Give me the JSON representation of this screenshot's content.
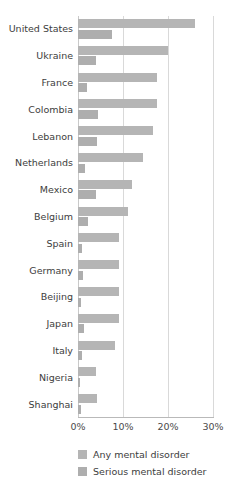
{
  "chart_data": {
    "type": "bar",
    "orientation": "horizontal",
    "title": "",
    "xlabel": "",
    "ylabel": "",
    "xlim": [
      0,
      30
    ],
    "xticks": [
      0,
      10,
      20,
      30
    ],
    "xtick_labels": [
      "0%",
      "10%",
      "20%",
      "30%"
    ],
    "grid": true,
    "legend_position": "bottom-left",
    "categories": [
      "United States",
      "Ukraine",
      "France",
      "Colombia",
      "Lebanon",
      "Netherlands",
      "Mexico",
      "Belgium",
      "Spain",
      "Germany",
      "Beijing",
      "Japan",
      "Italy",
      "Nigeria",
      "Shanghai"
    ],
    "series": [
      {
        "name": "Any mental disorder",
        "color": "#b5b5b5",
        "values": [
          26.0,
          20.0,
          17.5,
          17.5,
          16.7,
          14.5,
          12.0,
          11.2,
          9.2,
          9.1,
          9.0,
          9.0,
          8.2,
          4.0,
          4.2
        ]
      },
      {
        "name": "Serious mental disorder",
        "color": "#aeaeae",
        "values": [
          7.6,
          4.0,
          2.0,
          4.5,
          4.2,
          1.6,
          4.0,
          2.3,
          0.9,
          1.2,
          0.7,
          1.4,
          0.9,
          0.5,
          0.6
        ]
      }
    ]
  },
  "legend": {
    "items": [
      {
        "label": "Any mental disorder",
        "color": "#b5b5b5"
      },
      {
        "label": "Serious mental disorder",
        "color": "#aeaeae"
      }
    ]
  },
  "axis": {
    "tick_labels": [
      "0%",
      "10%",
      "20%",
      "30%"
    ]
  }
}
